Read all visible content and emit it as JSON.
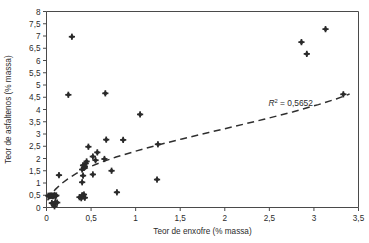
{
  "chart_data": {
    "type": "scatter",
    "title": "",
    "xlabel": "Teor de enxofre (% massa)",
    "ylabel": "Teor de asfaltenos (% massa)",
    "xlim": [
      0,
      3.5
    ],
    "ylim": [
      0,
      8
    ],
    "xticks": [
      0,
      0.5,
      1,
      1.5,
      2,
      2.5,
      3,
      3.5
    ],
    "yticks": [
      0,
      0.5,
      1,
      1.5,
      2,
      2.5,
      3,
      3.5,
      4,
      4.5,
      5,
      5.5,
      6,
      6.5,
      7,
      7.5,
      8
    ],
    "xtick_labels": [
      "0",
      "0,5",
      "1",
      "1,5",
      "2",
      "2,5",
      "3",
      "3,5"
    ],
    "ytick_labels": [
      "0",
      "0,5",
      "1",
      "1,5",
      "2",
      "2,5",
      "3",
      "3,5",
      "4",
      "4,5",
      "5",
      "5,5",
      "6",
      "6,5",
      "7",
      "7,5",
      "8"
    ],
    "grid": false,
    "legend": null,
    "decimal_separator": ",",
    "marker": "diamond-plus",
    "marker_color": "#2a2a2a",
    "annotations": [
      {
        "name": "r-squared",
        "text": "R² = 0,5652",
        "symbol": "R",
        "superscript": "2",
        "value_text": "= 0,5652",
        "value": 0.5652,
        "x": 2.49,
        "y": 4.14
      }
    ],
    "trendline": {
      "style": "dashed",
      "color": "#2f2f2f",
      "fit": "logarithmic",
      "r_squared": 0.5652,
      "points": [
        [
          0.012,
          0.29
        ],
        [
          0.05,
          0.52
        ],
        [
          0.1,
          0.74
        ],
        [
          0.16,
          0.95
        ],
        [
          0.24,
          1.17
        ],
        [
          0.34,
          1.4
        ],
        [
          0.46,
          1.62
        ],
        [
          0.6,
          1.83
        ],
        [
          0.78,
          2.06
        ],
        [
          1.0,
          2.3
        ],
        [
          1.25,
          2.55
        ],
        [
          1.52,
          2.8
        ],
        [
          1.82,
          3.06
        ],
        [
          2.12,
          3.32
        ],
        [
          2.44,
          3.6
        ],
        [
          2.76,
          3.9
        ],
        [
          3.05,
          4.2
        ],
        [
          3.25,
          4.43
        ],
        [
          3.4,
          4.63
        ]
      ]
    },
    "points": [
      {
        "x": 0.02,
        "y": 0.48
      },
      {
        "x": 0.03,
        "y": 0.46
      },
      {
        "x": 0.04,
        "y": 0.49
      },
      {
        "x": 0.05,
        "y": 0.47
      },
      {
        "x": 0.06,
        "y": 0.49
      },
      {
        "x": 0.07,
        "y": 0.46
      },
      {
        "x": 0.08,
        "y": 0.48
      },
      {
        "x": 0.09,
        "y": 0.5
      },
      {
        "x": 0.1,
        "y": 0.47
      },
      {
        "x": 0.11,
        "y": 0.49
      },
      {
        "x": 0.06,
        "y": 0.18
      },
      {
        "x": 0.08,
        "y": 0.12
      },
      {
        "x": 0.1,
        "y": 0.22
      },
      {
        "x": 0.12,
        "y": 0.2
      },
      {
        "x": 0.09,
        "y": 0.05
      },
      {
        "x": 0.14,
        "y": 1.32
      },
      {
        "x": 0.245,
        "y": 4.6
      },
      {
        "x": 0.285,
        "y": 6.97
      },
      {
        "x": 0.37,
        "y": 0.42
      },
      {
        "x": 0.39,
        "y": 0.38
      },
      {
        "x": 0.4,
        "y": 0.5
      },
      {
        "x": 0.41,
        "y": 0.45
      },
      {
        "x": 0.42,
        "y": 0.53
      },
      {
        "x": 0.43,
        "y": 0.4
      },
      {
        "x": 0.4,
        "y": 1.03
      },
      {
        "x": 0.41,
        "y": 1.3
      },
      {
        "x": 0.4,
        "y": 1.55
      },
      {
        "x": 0.42,
        "y": 1.62
      },
      {
        "x": 0.43,
        "y": 1.68
      },
      {
        "x": 0.41,
        "y": 1.72
      },
      {
        "x": 0.44,
        "y": 1.8
      },
      {
        "x": 0.45,
        "y": 1.88
      },
      {
        "x": 0.47,
        "y": 2.48
      },
      {
        "x": 0.52,
        "y": 2.08
      },
      {
        "x": 0.55,
        "y": 1.93
      },
      {
        "x": 0.57,
        "y": 2.25
      },
      {
        "x": 0.52,
        "y": 1.35
      },
      {
        "x": 0.65,
        "y": 1.98
      },
      {
        "x": 0.66,
        "y": 4.66
      },
      {
        "x": 0.67,
        "y": 2.77
      },
      {
        "x": 0.73,
        "y": 1.5
      },
      {
        "x": 0.79,
        "y": 0.62
      },
      {
        "x": 0.86,
        "y": 2.76
      },
      {
        "x": 1.05,
        "y": 3.8
      },
      {
        "x": 1.24,
        "y": 1.14
      },
      {
        "x": 1.25,
        "y": 2.58
      },
      {
        "x": 2.86,
        "y": 6.75
      },
      {
        "x": 2.92,
        "y": 6.27
      },
      {
        "x": 3.13,
        "y": 7.28
      },
      {
        "x": 3.33,
        "y": 4.62
      }
    ]
  }
}
